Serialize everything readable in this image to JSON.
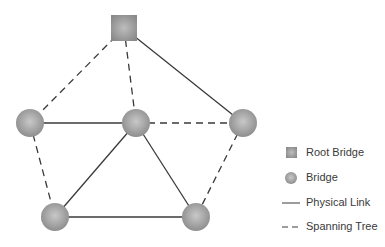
{
  "diagram": {
    "colors": {
      "node": "#9a9a9a",
      "node_highlight": "#c4c4c4",
      "line": "#3a3a3a",
      "background": "#ffffff"
    },
    "nodes": [
      {
        "id": "root",
        "type": "root-bridge",
        "x": 124,
        "y": 28
      },
      {
        "id": "left",
        "type": "bridge",
        "x": 30,
        "y": 123
      },
      {
        "id": "center",
        "type": "bridge",
        "x": 136,
        "y": 123
      },
      {
        "id": "right",
        "type": "bridge",
        "x": 243,
        "y": 123
      },
      {
        "id": "bottom-left",
        "type": "bridge",
        "x": 55,
        "y": 217
      },
      {
        "id": "bottom-right",
        "type": "bridge",
        "x": 196,
        "y": 217
      }
    ],
    "links": [
      {
        "from": "root",
        "to": "left",
        "style": "spanning-tree"
      },
      {
        "from": "root",
        "to": "center",
        "style": "spanning-tree"
      },
      {
        "from": "root",
        "to": "right",
        "style": "physical"
      },
      {
        "from": "left",
        "to": "center",
        "style": "physical"
      },
      {
        "from": "center",
        "to": "right",
        "style": "spanning-tree"
      },
      {
        "from": "left",
        "to": "bottom-left",
        "style": "spanning-tree"
      },
      {
        "from": "center",
        "to": "bottom-left",
        "style": "physical"
      },
      {
        "from": "center",
        "to": "bottom-right",
        "style": "physical"
      },
      {
        "from": "bottom-left",
        "to": "bottom-right",
        "style": "physical"
      },
      {
        "from": "right",
        "to": "bottom-right",
        "style": "spanning-tree"
      }
    ]
  },
  "legend": {
    "items": [
      {
        "icon": "root-bridge-square-icon",
        "label": "Root Bridge"
      },
      {
        "icon": "bridge-circle-icon",
        "label": "Bridge"
      },
      {
        "icon": "solid-line-icon",
        "label": "Physical Link"
      },
      {
        "icon": "dashed-line-icon",
        "label": "Spanning Tree"
      }
    ]
  }
}
